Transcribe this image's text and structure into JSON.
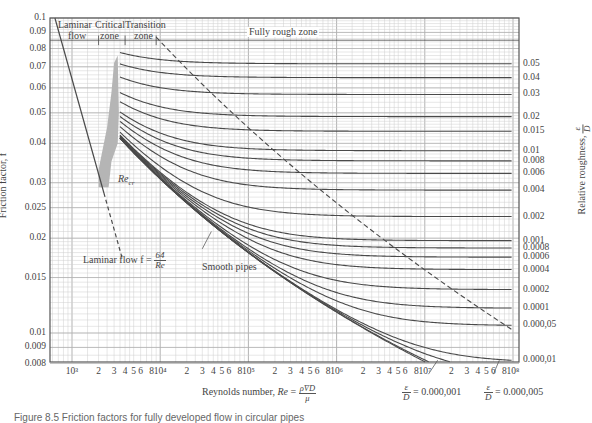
{
  "chart_data": {
    "type": "line",
    "xlabel": "Reynolds number, Re = ρVD/μ",
    "ylabel": "Friction factor, f",
    "y2label": "Relative roughness, ε/D",
    "xscale": "log",
    "yscale": "log",
    "xlim": [
      600,
      100000000
    ],
    "ylim": [
      0.008,
      0.1
    ],
    "grid": true,
    "x_ticks": [
      "10³",
      "2",
      "3",
      "4",
      "5",
      "6",
      "8",
      "10⁴",
      "2",
      "3",
      "4",
      "5",
      "6",
      "8",
      "10⁵",
      "2",
      "3",
      "4",
      "5",
      "6",
      "8",
      "10⁶",
      "2",
      "3",
      "4",
      "5",
      "6",
      "8",
      "10⁷",
      "2",
      "3",
      "4",
      "5",
      "6",
      "8",
      "10⁸"
    ],
    "y_ticks": [
      "0.1",
      "0.09",
      "0.08",
      "0.07",
      "0.06",
      "0.05",
      "0.04",
      "0.03",
      "0.025",
      "0.02",
      "0.015",
      "0.01",
      "0.009",
      "0.008"
    ],
    "y_tick_values": [
      0.1,
      0.09,
      0.08,
      0.07,
      0.06,
      0.05,
      0.04,
      0.03,
      0.025,
      0.02,
      0.015,
      0.01,
      0.009,
      0.008
    ],
    "roughness_labels": [
      "0.05",
      "0.04",
      "0.03",
      "0.02",
      "0.015",
      "0.01",
      "0.008",
      "0.006",
      "0.004",
      "0.002",
      "0.001",
      "0.0008",
      "0.0006",
      "0.0004",
      "0.0002",
      "0.0001",
      "0.000,05",
      "0.000,01"
    ],
    "roughness_values": [
      0.05,
      0.04,
      0.03,
      0.02,
      0.015,
      0.01,
      0.008,
      0.006,
      0.004,
      0.002,
      0.001,
      0.0008,
      0.0006,
      0.0004,
      0.0002,
      0.0001,
      5e-05,
      1e-05
    ],
    "extra_curves": [
      {
        "name": "ε/D = 0.000,005",
        "roughness": 5e-06
      },
      {
        "name": "ε/D = 0.000,001",
        "roughness": 1e-06
      },
      {
        "name": "Smooth pipes",
        "roughness": 0
      }
    ],
    "series": [
      {
        "name": "Laminar flow f = 64/Re",
        "equation": "f = 64/Re",
        "x_range": [
          600,
          4000
        ],
        "style": "solid to 2300, dashed beyond"
      },
      {
        "name": "Fully rough zone boundary",
        "style": "dashed"
      }
    ],
    "critical_Re_band": [
      2000,
      4000
    ],
    "annotations": [
      "Laminar flow",
      "Critical zone",
      "Transition zone",
      "Fully rough zone",
      "Re_cr",
      "Smooth pipes",
      "Laminar flow f = 64/Re",
      "ε/D = 0.000,001",
      "ε/D = 0.000,005"
    ]
  },
  "labels": {
    "zone_laminar_1": "Laminar",
    "zone_laminar_2": "flow",
    "zone_critical_1": "Critical",
    "zone_critical_2": "zone",
    "zone_transition_1": "Transition",
    "zone_transition_2": "zone",
    "zone_fully_rough": "Fully rough zone",
    "re_cr": "Re",
    "re_cr_sub": "cr",
    "laminar_eq_prefix": "Laminar flow f =",
    "laminar_eq_num": "64",
    "laminar_eq_den": "Re",
    "smooth_pipes": "Smooth pipes",
    "xlabel_prefix": "Reynolds number,",
    "xlabel_re": "Re",
    "xlabel_num": "ρV̄D",
    "xlabel_den": "μ",
    "ylabel": "Friction factor, f",
    "rlabel_prefix": "Relative roughness,",
    "rlabel_num": "ε",
    "rlabel_den": "D",
    "eps_num": "ε",
    "eps_den": "D",
    "eps1_value": "= 0.000,001",
    "eps2_value": "= 0.000,005",
    "caption": "Figure 8.5 Friction factors for fully developed flow in circular pipes"
  },
  "colors": {
    "curve": "#4a4a4a",
    "grid": "#cfcfcf",
    "frame": "#555555",
    "shade": "#b5b5b5"
  }
}
